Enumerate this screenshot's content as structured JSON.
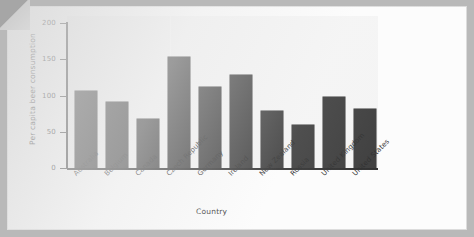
{
  "chart_data": {
    "type": "bar",
    "title": "",
    "xlabel": "Country",
    "ylabel": "Per capita beer consumption",
    "categories": [
      "Australia",
      "Belgium",
      "Canada",
      "Czech Republic",
      "Germany",
      "Ireland",
      "New Zealand",
      "Russia",
      "United Kingdom",
      "United States"
    ],
    "values": [
      109,
      94,
      70,
      157,
      115,
      132,
      80,
      61,
      100,
      83
    ],
    "ylim": [
      0,
      215
    ],
    "yticks": [
      0,
      50,
      100,
      150,
      200
    ],
    "ytick_labels": [
      "0",
      "50",
      "100",
      "150",
      "200"
    ],
    "grid": false,
    "legend": null,
    "bar_color": "#3b3b3b",
    "plot_bg": "#ececec",
    "page_bg": "#fcfcfc",
    "frame_color": "#b9b9b9",
    "axis_color": "#2f2f2f"
  }
}
